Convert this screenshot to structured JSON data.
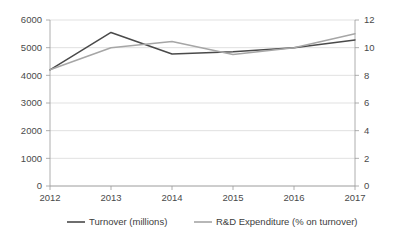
{
  "chart_data": {
    "type": "line",
    "title": "",
    "subtitle": "",
    "xlabel": "",
    "ylabel": "",
    "categories": [
      "2012",
      "2013",
      "2014",
      "2015",
      "2016",
      "2017"
    ],
    "x": [
      2012,
      2013,
      2014,
      2015,
      2016,
      2017
    ],
    "grid": true,
    "legend_position": "bottom",
    "series": [
      {
        "name": "Turnover (millions)",
        "axis": "left",
        "color": "#4a4a4a",
        "values": [
          4200,
          5550,
          4770,
          4850,
          5000,
          5280
        ]
      },
      {
        "name": "R&D Expenditure (% on turnover)",
        "axis": "right",
        "color": "#a6a6a6",
        "values": [
          8.4,
          10.0,
          10.45,
          9.5,
          10.0,
          11.0
        ]
      }
    ],
    "left_axis": {
      "label": "",
      "ylim": [
        0,
        6000
      ],
      "ticks": [
        0,
        1000,
        2000,
        3000,
        4000,
        5000,
        6000
      ],
      "tick_labels": [
        "0",
        "1000",
        "2000",
        "3000",
        "4000",
        "5000",
        "6000"
      ]
    },
    "right_axis": {
      "label": "",
      "ylim": [
        0,
        12
      ],
      "ticks": [
        0,
        2,
        4,
        6,
        8,
        10,
        12
      ],
      "tick_labels": [
        "0",
        "2",
        "4",
        "6",
        "8",
        "10",
        "12"
      ]
    },
    "legend": [
      {
        "label": "Turnover (millions)",
        "color": "#4a4a4a"
      },
      {
        "label": "R&D Expenditure (% on turnover)",
        "color": "#a6a6a6"
      }
    ]
  },
  "colors": {
    "background": "#ffffff",
    "grid": "#d4d4d4",
    "axis": "#9a9a9a",
    "text": "#3d3d3d",
    "series_turnover": "#4a4a4a",
    "series_rnd": "#a6a6a6"
  }
}
